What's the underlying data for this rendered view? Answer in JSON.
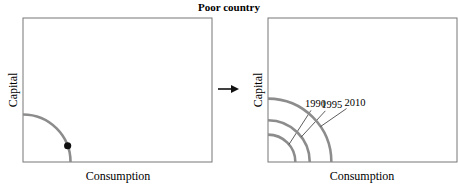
{
  "title": "Poor country",
  "chart_data": [
    {
      "type": "line",
      "panel": "left",
      "xlabel": "Consumption",
      "ylabel": "Capital",
      "curves": [
        {
          "label": "",
          "radius": 0.33
        }
      ],
      "point": {
        "on_curve": 0,
        "angle_deg": 20
      },
      "color": "#8c8c8c"
    },
    {
      "type": "line",
      "panel": "right",
      "xlabel": "Consumption",
      "ylabel": "Capital",
      "curves": [
        {
          "label": "1990",
          "radius": 0.19
        },
        {
          "label": "1995",
          "radius": 0.29
        },
        {
          "label": "2010",
          "radius": 0.44
        }
      ],
      "color": "#8c8c8c"
    }
  ],
  "arrow": {
    "direction": "right"
  }
}
